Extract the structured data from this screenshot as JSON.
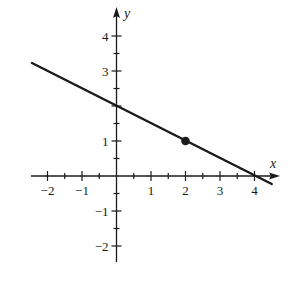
{
  "chart_data": {
    "type": "line",
    "title": "",
    "xlabel": "x",
    "ylabel": "y",
    "xlim": [
      -2.4,
      4.7
    ],
    "ylim": [
      -2.5,
      4.7
    ],
    "x_ticks": [
      -2,
      -1,
      1,
      2,
      3,
      4
    ],
    "y_ticks": [
      -2,
      -1,
      1,
      2,
      3,
      4
    ],
    "x_tick_labels": [
      "−2",
      "−1",
      "1",
      "2",
      "3",
      "4"
    ],
    "y_tick_labels": [
      "−2",
      "−1",
      "1",
      "3",
      "4"
    ],
    "minor_tick_step": 0.5,
    "grid": false,
    "series": [
      {
        "name": "line",
        "equation": "y = 2 - x/2",
        "x": [
          -2.45,
          4.5
        ],
        "y": [
          3.23,
          -0.23
        ],
        "color": "#1a1a1a"
      }
    ],
    "points": [
      {
        "x": 2,
        "y": 1,
        "label": "",
        "style": "filled-dot"
      }
    ],
    "annotations": []
  },
  "axes": {
    "x_label": "x",
    "y_label": "y",
    "x_tick_labels": [
      "−2",
      "−1",
      "1",
      "2",
      "3",
      "4"
    ],
    "y_tick_labels": [
      "4",
      "3",
      "1",
      "−1",
      "−2"
    ]
  }
}
